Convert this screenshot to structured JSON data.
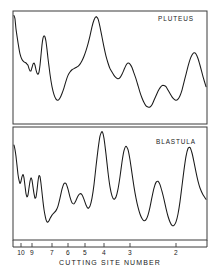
{
  "figure": {
    "background_color": "#ffffff",
    "line_color": "#1a1a1a",
    "frame_color": "#3a3a3a",
    "width": 222,
    "height": 272
  },
  "axis": {
    "title": "CUTTING SITE NUMBER",
    "tick_labels": [
      "10",
      "9",
      "7",
      "6",
      "5",
      "4",
      "3",
      "2"
    ],
    "tick_positions_px": [
      21,
      32,
      52,
      68,
      85,
      104,
      130,
      176
    ]
  },
  "panels": [
    {
      "label": "PLUTEUS",
      "label_x": 176,
      "label_y": 21
    },
    {
      "label": "BLASTULA",
      "label_x": 176,
      "label_y": 144
    }
  ],
  "chart_data": {
    "type": "line",
    "title": "",
    "xlabel": "CUTTING SITE NUMBER",
    "ylabel": "",
    "grid": false,
    "legend": "none",
    "x_tick_labels": [
      "10",
      "9",
      "7",
      "6",
      "5",
      "4",
      "3",
      "2"
    ],
    "x_tick_x_px": [
      21,
      32,
      52,
      68,
      85,
      104,
      130,
      176
    ],
    "xlim_px": [
      13,
      207
    ],
    "note": "Two stacked densitometer traces. Values are relative intensity read off the trace height in each panel (0 = panel floor, 100 = panel ceiling).",
    "series": [
      {
        "name": "PLUTEUS",
        "panel_index": 0,
        "panel_top_px": 11,
        "panel_bottom_px": 124,
        "x": [
          14,
          15,
          16,
          18,
          20,
          22,
          24,
          26,
          27,
          28,
          29,
          30,
          31,
          32,
          33,
          34,
          35,
          36,
          37,
          38,
          39,
          40,
          41,
          42,
          43,
          44,
          45,
          46,
          47,
          48,
          50,
          52,
          54,
          56,
          58,
          60,
          62,
          64,
          66,
          68,
          70,
          72,
          74,
          76,
          78,
          80,
          82,
          84,
          86,
          88,
          90,
          92,
          94,
          96,
          98,
          100,
          102,
          104,
          106,
          108,
          110,
          112,
          114,
          116,
          118,
          120,
          122,
          124,
          126,
          128,
          130,
          132,
          134,
          136,
          138,
          140,
          142,
          144,
          146,
          148,
          150,
          152,
          154,
          156,
          158,
          160,
          162,
          164,
          166,
          168,
          170,
          172,
          174,
          176,
          178,
          180,
          182,
          184,
          186,
          188,
          190,
          192,
          194,
          196,
          198,
          200,
          203,
          206
        ],
        "values": [
          96,
          93,
          84,
          72,
          62,
          57,
          55,
          54,
          53,
          52,
          49,
          47,
          47,
          50,
          53,
          54,
          52,
          48,
          45,
          44,
          46,
          52,
          61,
          70,
          76,
          78,
          77,
          73,
          66,
          58,
          44,
          33,
          26,
          22,
          21,
          23,
          27,
          32,
          38,
          43,
          46,
          48,
          49,
          50,
          51,
          53,
          56,
          60,
          65,
          71,
          78,
          86,
          92,
          95,
          93,
          86,
          77,
          68,
          60,
          54,
          49,
          46,
          43,
          41,
          40,
          41,
          44,
          48,
          52,
          54,
          53,
          50,
          45,
          40,
          34,
          28,
          23,
          19,
          16,
          15,
          15,
          17,
          21,
          25,
          29,
          32,
          34,
          34,
          33,
          30,
          27,
          24,
          22,
          21,
          22,
          25,
          30,
          37,
          44,
          51,
          57,
          61,
          63,
          62,
          58,
          52,
          42,
          33
        ]
      },
      {
        "name": "BLASTULA",
        "panel_index": 1,
        "panel_top_px": 127,
        "panel_bottom_px": 240,
        "x": [
          14,
          15,
          16,
          17,
          18,
          19,
          20,
          21,
          22,
          23,
          24,
          25,
          26,
          27,
          28,
          29,
          30,
          31,
          32,
          33,
          34,
          35,
          36,
          37,
          38,
          39,
          40,
          41,
          42,
          43,
          44,
          45,
          46,
          47,
          48,
          49,
          50,
          52,
          54,
          56,
          58,
          60,
          62,
          64,
          66,
          68,
          70,
          72,
          74,
          76,
          78,
          80,
          82,
          84,
          86,
          88,
          90,
          92,
          94,
          96,
          98,
          100,
          102,
          104,
          106,
          108,
          110,
          112,
          114,
          116,
          118,
          120,
          122,
          124,
          126,
          128,
          130,
          132,
          134,
          136,
          138,
          140,
          142,
          144,
          146,
          148,
          150,
          152,
          154,
          156,
          158,
          160,
          162,
          164,
          166,
          168,
          170,
          172,
          174,
          176,
          178,
          180,
          182,
          184,
          186,
          188,
          190,
          192,
          194,
          196,
          198,
          200,
          203,
          206
        ],
        "values": [
          84,
          80,
          74,
          66,
          58,
          53,
          50,
          52,
          56,
          58,
          55,
          48,
          41,
          38,
          40,
          46,
          52,
          55,
          53,
          47,
          41,
          37,
          38,
          44,
          52,
          57,
          56,
          50,
          42,
          34,
          27,
          22,
          18,
          16,
          16,
          17,
          19,
          22,
          24,
          26,
          30,
          37,
          45,
          50,
          50,
          45,
          38,
          33,
          32,
          35,
          39,
          41,
          40,
          36,
          31,
          28,
          30,
          37,
          49,
          65,
          80,
          92,
          96,
          90,
          76,
          60,
          47,
          39,
          36,
          38,
          45,
          56,
          69,
          79,
          83,
          80,
          71,
          59,
          47,
          37,
          29,
          23,
          19,
          17,
          18,
          22,
          29,
          38,
          46,
          51,
          52,
          49,
          43,
          36,
          28,
          21,
          16,
          13,
          13,
          16,
          23,
          34,
          48,
          62,
          74,
          81,
          82,
          77,
          69,
          60,
          52,
          46,
          40,
          36
        ]
      }
    ]
  }
}
